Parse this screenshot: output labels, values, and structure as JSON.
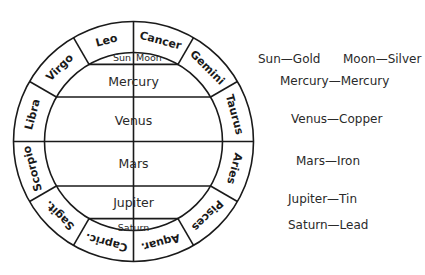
{
  "diagram": {
    "zodiac": [
      {
        "label": "Cancer",
        "angle": 15
      },
      {
        "label": "Gemini",
        "angle": 45
      },
      {
        "label": "Taurus",
        "angle": 75
      },
      {
        "label": "Aries",
        "angle": 105
      },
      {
        "label": "Pisces",
        "angle": 135
      },
      {
        "label": "Aquar.",
        "angle": 165
      },
      {
        "label": "Capric.",
        "angle": 195
      },
      {
        "label": "Sagit.",
        "angle": 225
      },
      {
        "label": "Scorpio",
        "angle": 255
      },
      {
        "label": "Libra",
        "angle": 285
      },
      {
        "label": "Virgo",
        "angle": 315
      },
      {
        "label": "Leo",
        "angle": 345
      }
    ],
    "planets": {
      "sun": "Sun",
      "moon": "Moon",
      "mercury": "Mercury",
      "venus": "Venus",
      "mars": "Mars",
      "jupiter": "Jupiter",
      "saturn": "Saturn"
    }
  },
  "legend": {
    "sun": "Sun—Gold",
    "moon": "Moon—Silver",
    "mercury": "Mercury—Mercury",
    "venus": "Venus—Copper",
    "mars": "Mars—Iron",
    "jupiter": "Jupiter—Tin",
    "saturn": "Saturn—Lead"
  }
}
